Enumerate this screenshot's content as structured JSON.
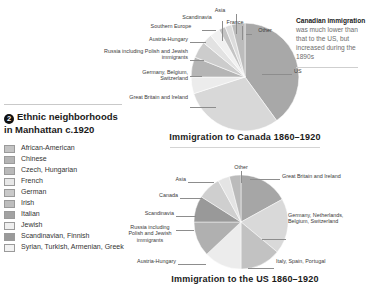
{
  "legend": {
    "number_badge": "2",
    "heading": "Ethnic neighborhoods in Manhattan c.1920",
    "items": [
      {
        "label": "African-American",
        "color": "#c3c3c3"
      },
      {
        "label": "Chinese",
        "color": "#b4b4b4"
      },
      {
        "label": "Czech, Hungarian",
        "color": "#b9b9b9"
      },
      {
        "label": "French",
        "color": "#e8e8e8"
      },
      {
        "label": "German",
        "color": "#c9c9c9"
      },
      {
        "label": "Irish",
        "color": "#bdbdbd"
      },
      {
        "label": "Italian",
        "color": "#a2a2a2"
      },
      {
        "label": "Jewish",
        "color": "#efefef"
      },
      {
        "label": "Scandinavian, Finnish",
        "color": "#9a9a9a"
      },
      {
        "label": "Syrian, Turkish, Armenian, Greek",
        "color": "#f2f2f2"
      }
    ]
  },
  "side_note": {
    "lead": "Canadian immigration",
    "body": " was much lower than that to the US, but increased during the 1890s"
  },
  "chart_data": [
    {
      "type": "pie",
      "id": "canada",
      "title": "Immigration to Canada 1860–1920",
      "labels": [
        "US",
        "Great Britain and Ireland",
        "Germany, Belgium, Switzerland",
        "Russia including Polish and Jewish immigrants",
        "Austria-Hungary",
        "Southern Europe",
        "Scandinavia",
        "Asia",
        "France",
        "Other"
      ],
      "values": [
        40,
        30,
        5,
        6,
        5,
        3,
        3,
        2,
        2,
        4
      ],
      "colors": [
        "#a8a8a8",
        "#d8d8d8",
        "#ececec",
        "#b5b5b5",
        "#cccccc",
        "#e2e2e2",
        "#f1f1f1",
        "#c4c4c4",
        "#dcdcdc",
        "#bcbcbc"
      ],
      "start_angle": -90,
      "legend_position": "callouts"
    },
    {
      "type": "pie",
      "id": "us",
      "title": "Immigration to the US 1860–1920",
      "labels": [
        "Great Britain and Ireland",
        "Germany, Netherlands, Belgium, Switzerland",
        "Italy, Spain, Portugal",
        "Austria-Hungary",
        "Russia including Polish and Jewish immigrants",
        "Scandinavia",
        "Canada",
        "Asia",
        "Other"
      ],
      "values": [
        17,
        19,
        14,
        13,
        12,
        9,
        8,
        4,
        4
      ],
      "colors": [
        "#a6a6a6",
        "#d9d9d9",
        "#c2c2c2",
        "#ececec",
        "#b0b0b0",
        "#999999",
        "#cfcfcf",
        "#e4e4e4",
        "#bbbbbb"
      ],
      "start_angle": -90,
      "legend_position": "callouts"
    }
  ]
}
